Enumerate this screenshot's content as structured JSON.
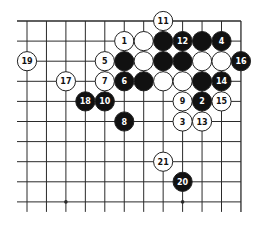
{
  "diagram": {
    "type": "go-board-fragment",
    "grid": {
      "columns": 12,
      "rows": 10,
      "edges": [
        "top",
        "right"
      ]
    },
    "colors": {
      "background": "#ffffff",
      "line": "#2a2a2a",
      "black_stone": "#111111",
      "white_stone": "#ffffff",
      "black_label": "#ffffff",
      "white_label": "#111111"
    },
    "star_points": [
      {
        "col": 2,
        "row": 9
      },
      {
        "col": 8,
        "row": 9
      }
    ],
    "stones": [
      {
        "color": "white",
        "col": 7,
        "row": 0,
        "label": "11"
      },
      {
        "color": "white",
        "col": 5,
        "row": 1,
        "label": "1"
      },
      {
        "color": "white",
        "col": 6,
        "row": 1,
        "label": ""
      },
      {
        "color": "black",
        "col": 7,
        "row": 1,
        "label": ""
      },
      {
        "color": "black",
        "col": 8,
        "row": 1,
        "label": "12"
      },
      {
        "color": "black",
        "col": 9,
        "row": 1,
        "label": ""
      },
      {
        "color": "black",
        "col": 10,
        "row": 1,
        "label": "4"
      },
      {
        "color": "white",
        "col": 0,
        "row": 2,
        "label": "19"
      },
      {
        "color": "white",
        "col": 4,
        "row": 2,
        "label": "5"
      },
      {
        "color": "black",
        "col": 5,
        "row": 2,
        "label": ""
      },
      {
        "color": "white",
        "col": 6,
        "row": 2,
        "label": ""
      },
      {
        "color": "black",
        "col": 7,
        "row": 2,
        "label": ""
      },
      {
        "color": "black",
        "col": 8,
        "row": 2,
        "label": ""
      },
      {
        "color": "white",
        "col": 9,
        "row": 2,
        "label": ""
      },
      {
        "color": "white",
        "col": 10,
        "row": 2,
        "label": ""
      },
      {
        "color": "black",
        "col": 11,
        "row": 2,
        "label": "16"
      },
      {
        "color": "white",
        "col": 2,
        "row": 3,
        "label": "17"
      },
      {
        "color": "white",
        "col": 4,
        "row": 3,
        "label": "7"
      },
      {
        "color": "black",
        "col": 5,
        "row": 3,
        "label": "6"
      },
      {
        "color": "black",
        "col": 6,
        "row": 3,
        "label": ""
      },
      {
        "color": "white",
        "col": 7,
        "row": 3,
        "label": ""
      },
      {
        "color": "white",
        "col": 8,
        "row": 3,
        "label": ""
      },
      {
        "color": "black",
        "col": 9,
        "row": 3,
        "label": ""
      },
      {
        "color": "black",
        "col": 10,
        "row": 3,
        "label": "14"
      },
      {
        "color": "black",
        "col": 3,
        "row": 4,
        "label": "18"
      },
      {
        "color": "black",
        "col": 4,
        "row": 4,
        "label": "10"
      },
      {
        "color": "white",
        "col": 8,
        "row": 4,
        "label": "9"
      },
      {
        "color": "black",
        "col": 9,
        "row": 4,
        "label": "2"
      },
      {
        "color": "white",
        "col": 10,
        "row": 4,
        "label": "15"
      },
      {
        "color": "black",
        "col": 5,
        "row": 5,
        "label": "8"
      },
      {
        "color": "white",
        "col": 8,
        "row": 5,
        "label": "3"
      },
      {
        "color": "white",
        "col": 9,
        "row": 5,
        "label": "13"
      },
      {
        "color": "white",
        "col": 7,
        "row": 7,
        "label": "21"
      },
      {
        "color": "black",
        "col": 8,
        "row": 8,
        "label": "20"
      }
    ]
  }
}
